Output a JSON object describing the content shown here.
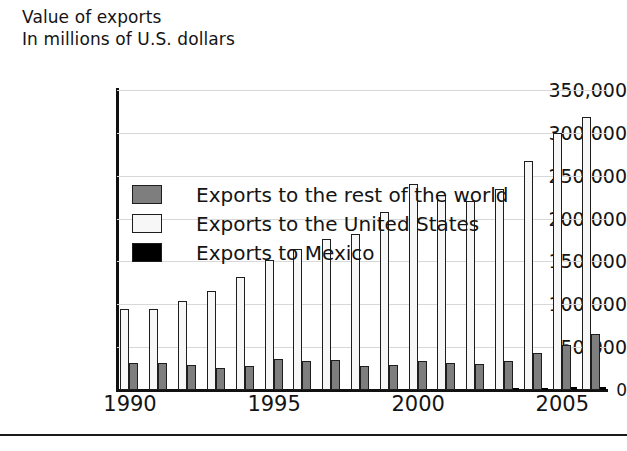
{
  "title": {
    "line1": "Value of exports",
    "line2": "In millions of U.S. dollars"
  },
  "legend": {
    "position": "top-left-inside",
    "items": [
      {
        "key": "row",
        "label": "Exports to the rest of the world",
        "color": "#7e7e7e"
      },
      {
        "key": "us",
        "label": "Exports to the United States",
        "color": "#f7f7f7"
      },
      {
        "key": "mex",
        "label": "Exports to Mexico",
        "color": "#000000"
      }
    ]
  },
  "chart_data": {
    "type": "bar",
    "title": "Value of exports",
    "subtitle": "In millions of U.S. dollars",
    "xlabel": "",
    "ylabel": "In millions of U.S. dollars",
    "ylim": [
      0,
      350000
    ],
    "ytick_step": 50000,
    "grid": true,
    "categories": [
      "1990",
      "1991",
      "1992",
      "1993",
      "1994",
      "1995",
      "1996",
      "1997",
      "1998",
      "1999",
      "2000",
      "2001",
      "2002",
      "2003",
      "2004",
      "2005",
      "2006"
    ],
    "xtick_labels": [
      "1990",
      "1995",
      "2000",
      "2005"
    ],
    "ytick_labels": [
      "0",
      "50,000",
      "100,000",
      "150,000",
      "200,000",
      "250,000",
      "300,000",
      "350,000"
    ],
    "series": [
      {
        "name": "Exports to the United States",
        "key": "us",
        "color": "#f7f7f7",
        "values": [
          95000,
          94000,
          104000,
          115000,
          132000,
          152000,
          164000,
          176000,
          182000,
          208000,
          240000,
          228000,
          220000,
          235000,
          267000,
          300000,
          319000
        ]
      },
      {
        "name": "Exports to the rest of the world",
        "key": "row",
        "color": "#7e7e7e",
        "values": [
          32000,
          31000,
          29000,
          26000,
          28000,
          36000,
          34000,
          35000,
          28000,
          29000,
          34000,
          31000,
          30000,
          34000,
          43000,
          53000,
          65000
        ]
      },
      {
        "name": "Exports to Mexico",
        "key": "mex",
        "color": "#000000",
        "values": [
          0,
          0,
          0,
          0,
          0,
          0,
          0,
          0,
          0,
          0,
          0,
          0,
          0,
          1000,
          2000,
          3000,
          4000
        ]
      }
    ]
  }
}
